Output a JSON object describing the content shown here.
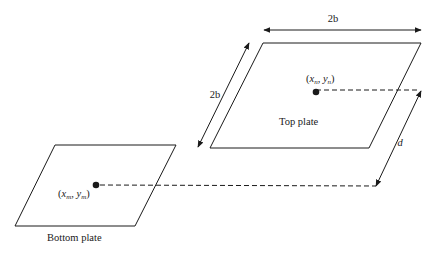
{
  "diagram": {
    "title": "",
    "plates": [
      {
        "id": "top",
        "label": "Top plate",
        "point_label": {
          "x": "x",
          "x_sub": "n",
          "y": "y",
          "y_sub": "n"
        }
      },
      {
        "id": "bottom",
        "label": "Bottom plate",
        "point_label": {
          "x": "x",
          "x_sub": "m",
          "y": "y",
          "y_sub": "m"
        }
      }
    ],
    "dimensions": {
      "width_label": "2b",
      "depth_label": "2b",
      "separation_label": "d"
    },
    "colors": {
      "stroke": "#1a1a1a",
      "background": "#ffffff"
    }
  }
}
